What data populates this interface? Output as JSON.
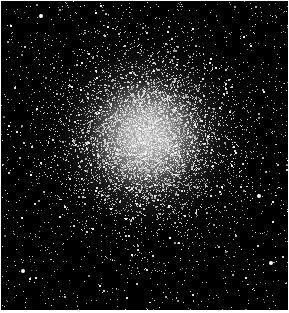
{
  "image": {
    "subject": "globular star cluster",
    "description": "Black-and-white photograph of a dense globular star cluster against a black sky",
    "background_color": "#000000",
    "star_color": "#ffffff",
    "border_color": "#ffffff",
    "core": {
      "cx": 145,
      "cy": 135,
      "radius": 95
    },
    "star_counts": {
      "core": 9000,
      "field": 1400
    },
    "seed": 42
  }
}
